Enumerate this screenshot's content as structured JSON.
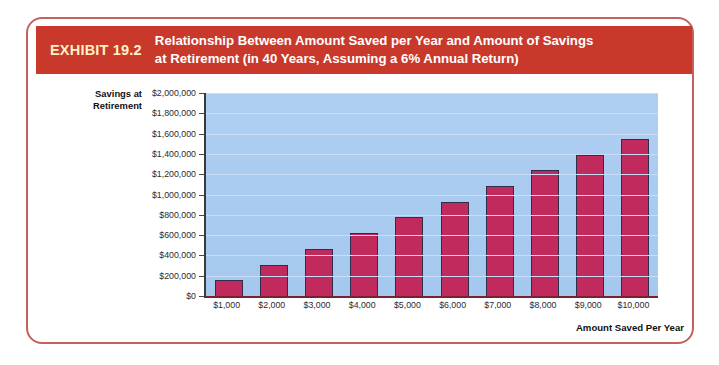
{
  "exhibit": {
    "number": "EXHIBIT 19.2",
    "title_line1": "Relationship Between Amount Saved per Year and Amount of Savings",
    "title_line2": "at Retirement (in 40 Years, Assuming a 6% Annual Return)",
    "header_color": "#C8392B",
    "frame_color": "#C4615C",
    "number_color": "#FFF3C4"
  },
  "chart_data": {
    "type": "bar",
    "title": "Relationship Between Amount Saved per Year and Amount of Savings at Retirement (in 40 Years, Assuming a 6% Annual Return)",
    "xlabel": "Amount Saved Per Year",
    "ylabel": "Savings at Retirement",
    "ylabel_line1": "Savings at",
    "ylabel_line2": "Retirement",
    "categories": [
      "$1,000",
      "$2,000",
      "$3,000",
      "$4,000",
      "$5,000",
      "$6,000",
      "$7,000",
      "$8,000",
      "$9,000",
      "$10,000"
    ],
    "values": [
      155000,
      310000,
      464000,
      619000,
      774000,
      929000,
      1083000,
      1238000,
      1393000,
      1548000
    ],
    "ylim": [
      0,
      2000000
    ],
    "ytick_values": [
      0,
      200000,
      400000,
      600000,
      800000,
      1000000,
      1200000,
      1400000,
      1600000,
      1800000,
      2000000
    ],
    "ytick_labels": [
      "$0",
      "$200,000",
      "$400,000",
      "$600,000",
      "$800,000",
      "$1,000,000",
      "$1,200,000",
      "$1,400,000",
      "$1,600,000",
      "$1,800,000",
      "$2,000,000"
    ],
    "grid": true,
    "legend": null,
    "bar_color": "#C12A5C",
    "plot_background": "#A8CBEF",
    "gridline_color": "#C9DEF6"
  }
}
